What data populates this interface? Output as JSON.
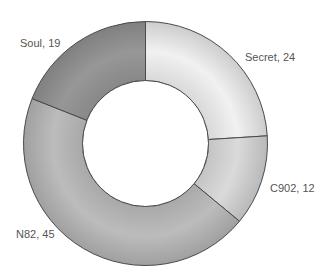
{
  "chart_data": {
    "type": "pie",
    "subtype": "donut",
    "title": "",
    "categories": [
      "Secret",
      "C902",
      "N82",
      "Soul"
    ],
    "values": [
      24,
      12,
      45,
      19
    ],
    "labels": [
      "Secret, 24",
      "C902, 12",
      "N82, 45",
      "Soul, 19"
    ],
    "colors": [
      "#f1f1f1",
      "#dadada",
      "#bcbcbc",
      "#979797"
    ],
    "start_angle_deg": 0,
    "direction": "clockwise",
    "inner_radius_ratio": 0.52,
    "legend": "none",
    "stroke_color": "#4a4a4a"
  },
  "geometry": {
    "cx": 145.5,
    "cy": 143.5,
    "outer_r": 122,
    "inner_r": 63
  },
  "label_positions": [
    {
      "x": 245,
      "y": 51
    },
    {
      "x": 270,
      "y": 182
    },
    {
      "x": 16,
      "y": 228
    },
    {
      "x": 20,
      "y": 37
    }
  ]
}
